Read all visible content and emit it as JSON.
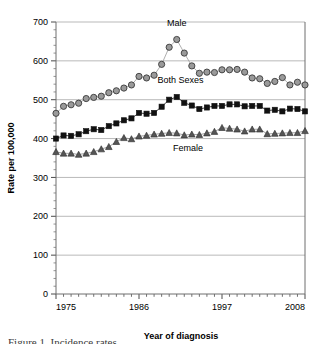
{
  "chart_data": {
    "type": "line",
    "title": "",
    "xlabel": "Year of diagnosis",
    "ylabel": "Rate per 100,000",
    "xlim": [
      1975,
      2008
    ],
    "ylim": [
      0,
      700
    ],
    "ytick_step": 100,
    "yticks": [
      0,
      100,
      200,
      300,
      400,
      500,
      600,
      700
    ],
    "xticks": [
      1975,
      1986,
      1997,
      2008
    ],
    "xtick_labels": [
      "1975",
      "1986",
      "1997",
      "2008"
    ],
    "minor_xtick_step": 1,
    "grid": "horizontal",
    "legend": "inline-annotations",
    "x": [
      1975,
      1976,
      1977,
      1978,
      1979,
      1980,
      1981,
      1982,
      1983,
      1984,
      1985,
      1986,
      1987,
      1988,
      1989,
      1990,
      1991,
      1992,
      1993,
      1994,
      1995,
      1996,
      1997,
      1998,
      1999,
      2000,
      2001,
      2002,
      2003,
      2004,
      2005,
      2006,
      2007,
      2008
    ],
    "series": [
      {
        "name": "Male",
        "marker": "circle",
        "marker_fill": "#9a9a9a",
        "marker_stroke": "#3a3a3a",
        "line_color": "#9a9a9a",
        "label": "Male",
        "values": [
          465,
          483,
          487,
          491,
          503,
          506,
          509,
          518,
          523,
          530,
          538,
          560,
          556,
          563,
          591,
          635,
          655,
          620,
          587,
          568,
          571,
          570,
          577,
          577,
          578,
          571,
          556,
          554,
          542,
          547,
          557,
          538,
          545,
          538
        ]
      },
      {
        "name": "Both Sexes",
        "marker": "square",
        "marker_fill": "#111111",
        "marker_stroke": "#111111",
        "line_color": "#111111",
        "label": "Both Sexes",
        "values": [
          400,
          408,
          407,
          411,
          419,
          424,
          422,
          432,
          439,
          447,
          452,
          466,
          464,
          466,
          482,
          500,
          507,
          492,
          485,
          476,
          480,
          484,
          484,
          488,
          488,
          483,
          484,
          484,
          472,
          474,
          470,
          477,
          476,
          470
        ]
      },
      {
        "name": "Female",
        "marker": "triangle",
        "marker_fill": "#555555",
        "marker_stroke": "#2b2b2b",
        "line_color": "#8a8a8a",
        "label": "Female",
        "values": [
          366,
          362,
          362,
          359,
          362,
          366,
          373,
          379,
          392,
          402,
          399,
          406,
          408,
          411,
          413,
          415,
          414,
          409,
          411,
          410,
          414,
          418,
          428,
          426,
          424,
          419,
          424,
          424,
          412,
          413,
          414,
          415,
          415,
          420
        ]
      }
    ],
    "annotations": [
      {
        "text": "Male",
        "x": 1991,
        "y": 690,
        "name": "male-series-label"
      },
      {
        "text": "Both Sexes",
        "x": 1991.5,
        "y": 543,
        "name": "both-sexes-series-label"
      },
      {
        "text": "Female",
        "x": 1992.5,
        "y": 368,
        "name": "female-series-label"
      }
    ]
  },
  "caption": {
    "text": "Figure 1. Incidence rates"
  }
}
